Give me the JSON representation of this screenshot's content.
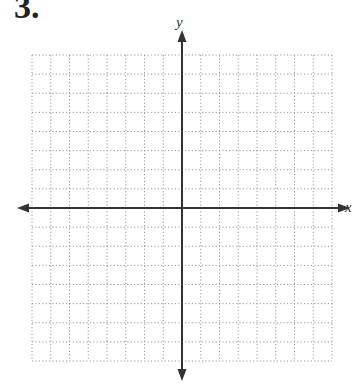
{
  "problem": {
    "number": "3."
  },
  "graph": {
    "grid_cells_x": 16,
    "grid_cells_y": 16,
    "x_axis_label": "x",
    "y_axis_label": "y",
    "grid_color": "#9a9a9a",
    "axis_color": "#333333"
  }
}
